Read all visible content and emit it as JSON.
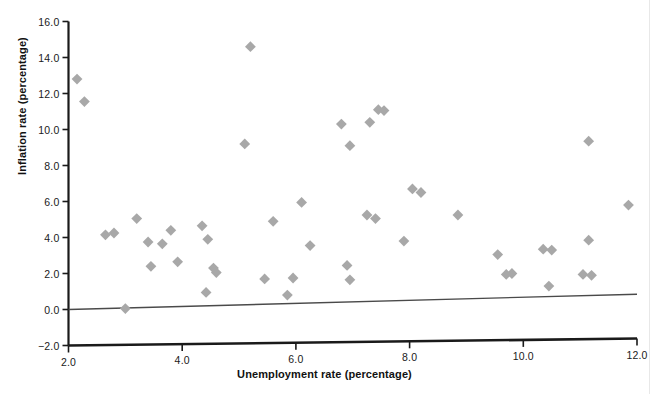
{
  "chart_data": {
    "type": "scatter",
    "title": "",
    "xlabel": "Unemployment rate (percentage)",
    "ylabel": "Inflation rate (percentage)",
    "xlim": [
      2.0,
      12.0
    ],
    "ylim": [
      -2.0,
      16.0
    ],
    "xticks": [
      "2.0",
      "4.0",
      "6.0",
      "8.0",
      "10.0",
      "12.0"
    ],
    "xtick_values": [
      2.0,
      4.0,
      6.0,
      8.0,
      10.0,
      12.0
    ],
    "yticks": [
      "16.0",
      "14.0",
      "12.0",
      "10.0",
      "8.0",
      "6.0",
      "4.0",
      "2.0",
      "0.0",
      "-2.0"
    ],
    "ytick_values": [
      16.0,
      14.0,
      12.0,
      10.0,
      8.0,
      6.0,
      4.0,
      2.0,
      0.0,
      -2.0
    ],
    "grid": false,
    "legend": "none",
    "marker": "diamond",
    "marker_color": "#a8a8a8",
    "axis_color": "#1a1a1a",
    "trendline_color": "#4a4a4a",
    "series": [
      {
        "name": "Unemployment vs Inflation",
        "points": [
          [
            2.15,
            12.8
          ],
          [
            2.28,
            11.55
          ],
          [
            2.65,
            4.15
          ],
          [
            2.8,
            4.25
          ],
          [
            3.0,
            0.05
          ],
          [
            3.2,
            5.05
          ],
          [
            3.4,
            3.75
          ],
          [
            3.45,
            2.4
          ],
          [
            3.65,
            3.65
          ],
          [
            3.8,
            4.4
          ],
          [
            3.92,
            2.65
          ],
          [
            4.35,
            4.65
          ],
          [
            4.45,
            3.9
          ],
          [
            4.55,
            2.3
          ],
          [
            4.6,
            2.05
          ],
          [
            4.42,
            0.95
          ],
          [
            5.2,
            14.6
          ],
          [
            5.1,
            9.2
          ],
          [
            5.45,
            1.7
          ],
          [
            5.6,
            4.9
          ],
          [
            5.85,
            0.8
          ],
          [
            5.95,
            1.75
          ],
          [
            6.1,
            5.95
          ],
          [
            6.25,
            3.55
          ],
          [
            6.8,
            10.3
          ],
          [
            6.95,
            9.1
          ],
          [
            6.9,
            2.45
          ],
          [
            6.95,
            1.65
          ],
          [
            7.3,
            10.4
          ],
          [
            7.45,
            11.1
          ],
          [
            7.55,
            11.05
          ],
          [
            7.25,
            5.25
          ],
          [
            7.4,
            5.05
          ],
          [
            7.9,
            3.8
          ],
          [
            8.05,
            6.7
          ],
          [
            8.2,
            6.5
          ],
          [
            8.85,
            5.25
          ],
          [
            9.55,
            3.05
          ],
          [
            9.7,
            1.95
          ],
          [
            9.8,
            2.0
          ],
          [
            10.35,
            3.35
          ],
          [
            10.5,
            3.3
          ],
          [
            10.45,
            1.3
          ],
          [
            11.15,
            9.35
          ],
          [
            11.15,
            3.85
          ],
          [
            11.05,
            1.95
          ],
          [
            11.2,
            1.9
          ],
          [
            11.85,
            5.8
          ]
        ]
      }
    ],
    "trendline": {
      "x_start": 2.0,
      "y_start": 0.0,
      "x_end": 12.0,
      "y_end": 0.85
    }
  }
}
